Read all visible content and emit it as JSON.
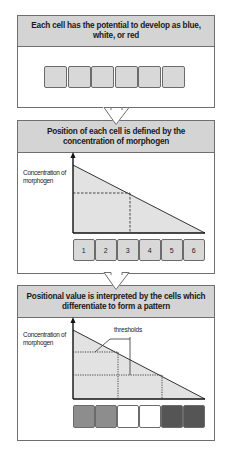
{
  "panels": [
    {
      "title": "Each cell has the potential to develop as blue, white, or red",
      "cells": [
        "",
        "",
        "",
        "",
        "",
        ""
      ]
    },
    {
      "title": "Position of each cell is defined by the concentration of morphogen",
      "y_axis_label": "Concentration of morphogen",
      "cells": [
        "1",
        "2",
        "3",
        "4",
        "5",
        "6"
      ],
      "marked_cell": "3"
    },
    {
      "title": "Positional value is interpreted by the cells which differentiate to form a pattern",
      "y_axis_label": "Concentration of morphogen",
      "annotation": "thresholds",
      "cell_colors": [
        "#8d8d8d",
        "#8d8d8d",
        "#ffffff",
        "#ffffff",
        "#555555",
        "#555555"
      ]
    }
  ],
  "colors": {
    "header_bg": "#d4d4d4",
    "cell_bg": "#d8d8d8",
    "gradient_fill": "#e2e2e2",
    "border": "#6f6f6f"
  }
}
